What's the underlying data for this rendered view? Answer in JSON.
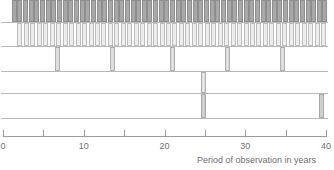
{
  "chart_data": {
    "type": "bar",
    "title": "",
    "subtitle": "",
    "xlabel": "Period of observation in years",
    "ylabel": "",
    "xlim": [
      0,
      40
    ],
    "ylim": [
      0,
      5
    ],
    "grid": false,
    "legend": null,
    "orientation": "vertical",
    "x_ticks": [
      0,
      5,
      10,
      15,
      20,
      25,
      30,
      35,
      40
    ],
    "x_tick_labels": [
      "0",
      "",
      "10",
      "",
      "20",
      "",
      "30",
      "",
      "40"
    ],
    "colors": {
      "band1_fill": "#a8a8a8",
      "band1_stroke": "#8f8f8f",
      "band2_fill": "#ededed",
      "band2_stroke": "#bdbdbd",
      "band3_fill": "#dedede",
      "band3_stroke": "#b0b0b0",
      "band4_fill": "#e2e2e2",
      "band4_stroke": "#b0b0b0",
      "band5_fill": "#cfcfcf",
      "band5_stroke": "#a8a8a8",
      "axis": "#9b9b9b",
      "baseline": "#b9b9b9",
      "text": "#6f6f6f",
      "background": "#ffffff"
    },
    "series": [
      {
        "name": "row-1",
        "row": 1,
        "fill": "#a8a8a8",
        "stroke": "#8f8f8f",
        "top": 0,
        "height": 23,
        "values": [
          1.4,
          2.1,
          2.8,
          3.5,
          4.2,
          4.9,
          5.6,
          6.3,
          7.0,
          7.7,
          8.4,
          9.1,
          9.8,
          10.5,
          11.2,
          11.9,
          12.6,
          13.3,
          14.0,
          14.7,
          15.4,
          16.1,
          16.8,
          17.5,
          18.2,
          18.9,
          19.6,
          20.3,
          21.0,
          21.7,
          22.4,
          23.1,
          23.8,
          24.5,
          25.2,
          25.9,
          26.6,
          27.3,
          28.0,
          28.7,
          29.4,
          30.1,
          30.8,
          31.5,
          32.2,
          32.9,
          33.6,
          34.3,
          35.0,
          35.7,
          36.4,
          37.1,
          37.8,
          38.5,
          39.2,
          39.8
        ]
      },
      {
        "name": "row-2",
        "row": 2,
        "fill": "#ededed",
        "stroke": "#bdbdbd",
        "top": 23,
        "height": 24,
        "values": [
          2.1,
          2.9,
          3.7,
          4.5,
          5.3,
          6.1,
          6.9,
          7.7,
          8.5,
          9.3,
          10.1,
          10.9,
          11.7,
          12.5,
          13.3,
          14.1,
          14.9,
          15.7,
          16.5,
          17.3,
          18.1,
          18.9,
          19.7,
          20.5,
          21.3,
          22.1,
          22.9,
          23.7,
          24.5,
          25.3,
          26.1,
          26.9,
          27.7,
          28.5,
          29.3,
          30.1,
          30.9,
          31.7,
          32.5,
          33.3,
          34.1,
          34.9,
          35.7,
          36.5,
          37.3,
          38.1,
          38.9,
          39.7
        ]
      },
      {
        "name": "row-3",
        "row": 3,
        "fill": "#dedede",
        "stroke": "#b0b0b0",
        "top": 47,
        "height": 25,
        "values": [
          6.8,
          13.5,
          21.0,
          27.8,
          34.6
        ]
      },
      {
        "name": "row-4",
        "row": 4,
        "fill": "#e2e2e2",
        "stroke": "#b0b0b0",
        "top": 72,
        "height": 22,
        "values": [
          24.8
        ]
      },
      {
        "name": "row-5",
        "row": 5,
        "fill": "#cfcfcf",
        "stroke": "#a8a8a8",
        "top": 94,
        "height": 25,
        "values": [
          24.8,
          39.4
        ]
      }
    ]
  },
  "axis": {
    "title": "Period of observation in years",
    "ticks": [
      {
        "value": 0,
        "label": "0"
      },
      {
        "value": 5,
        "label": ""
      },
      {
        "value": 10,
        "label": "10"
      },
      {
        "value": 15,
        "label": ""
      },
      {
        "value": 20,
        "label": "20"
      },
      {
        "value": 25,
        "label": ""
      },
      {
        "value": 30,
        "label": "30"
      },
      {
        "value": 35,
        "label": ""
      },
      {
        "value": 40,
        "label": "40"
      }
    ]
  },
  "geometry": {
    "plot_left": 3,
    "plot_right": 326,
    "axis_line_y": 136,
    "tick_top": 130,
    "tick_height": 7,
    "tick_label_y": 141,
    "axis_title_x": 197,
    "axis_title_y": 155,
    "bar_width": 5
  }
}
